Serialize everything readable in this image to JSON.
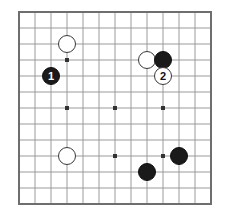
{
  "diagram": {
    "kind": "go-board-diagram",
    "board": {
      "size": 13,
      "line_color": "#9a9a9a",
      "border_color": "#6e6e6e",
      "background_color": "#ffffff",
      "star_point_color": "#333333",
      "left_px": 19,
      "top_px": 12,
      "spacing_px": 16,
      "border_width_px": 2,
      "line_width_px": 1,
      "star_size_px": 4,
      "star_points": [
        {
          "col": 3,
          "row": 3
        },
        {
          "col": 9,
          "row": 3
        },
        {
          "col": 3,
          "row": 6
        },
        {
          "col": 6,
          "row": 6
        },
        {
          "col": 9,
          "row": 6
        },
        {
          "col": 3,
          "row": 9
        },
        {
          "col": 6,
          "row": 9
        },
        {
          "col": 9,
          "row": 9
        }
      ]
    },
    "stones": [
      {
        "id": "white-upper-left",
        "color": "white",
        "col": 3,
        "row": 2,
        "label": "",
        "radius_px": 9
      },
      {
        "id": "black-move-1",
        "color": "black",
        "col": 2,
        "row": 4,
        "label": "1",
        "radius_px": 9
      },
      {
        "id": "white-upper-right",
        "color": "white",
        "col": 8,
        "row": 3,
        "label": "",
        "radius_px": 9
      },
      {
        "id": "black-upper-right",
        "color": "black",
        "col": 9,
        "row": 3,
        "label": "",
        "radius_px": 9
      },
      {
        "id": "white-move-2",
        "color": "white",
        "col": 9,
        "row": 4,
        "label": "2",
        "radius_px": 9
      },
      {
        "id": "white-lower-left",
        "color": "white",
        "col": 3,
        "row": 9,
        "label": "",
        "radius_px": 9
      },
      {
        "id": "black-lower-right-edge",
        "color": "black",
        "col": 10,
        "row": 9,
        "label": "",
        "radius_px": 9
      },
      {
        "id": "black-lower-center",
        "color": "black",
        "col": 8,
        "row": 10,
        "label": "",
        "radius_px": 9
      }
    ],
    "move_labels": {
      "move_1": "1",
      "move_2": "2"
    },
    "colors": {
      "black_stone": "#1a1a1a",
      "white_stone": "#ffffff",
      "black_stone_text": "#ffffff",
      "white_stone_text": "#111111",
      "grid_line": "#9a9a9a",
      "board_border": "#6e6e6e"
    }
  }
}
